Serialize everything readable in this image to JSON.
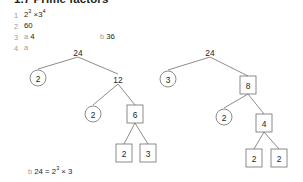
{
  "header": {
    "title": "1.7 Prime factors"
  },
  "answers": [
    {
      "number": "1",
      "parts": [
        {
          "label": "",
          "value": "2³ × 3⁴",
          "base1": "2",
          "exp1": "3",
          "base2": "3",
          "exp2": "4"
        }
      ]
    },
    {
      "number": "2",
      "parts": [
        {
          "label": "",
          "value": "60"
        }
      ]
    },
    {
      "number": "3",
      "parts": [
        {
          "label": "a",
          "value": "4"
        },
        {
          "label": "b",
          "value": "36"
        }
      ]
    },
    {
      "number": "4",
      "parts": [
        {
          "label": "a",
          "value": ""
        },
        {
          "label": "b",
          "value": "24 = 2³ × 3"
        }
      ]
    }
  ],
  "list": {
    "q1_num": "1",
    "q1_value_base1": "2",
    "q1_value_exp1": "3",
    "q1_times": "×",
    "q1_value_base2": "3",
    "q1_value_exp2": "4",
    "q2_num": "2",
    "q2_value": "60",
    "q3_num": "3",
    "q3_a_label": "a",
    "q3_a_value": "4",
    "q3_b_label": "b",
    "q3_b_value": "36",
    "q4_num": "4",
    "q4_a_label": "a",
    "q4_b_label": "b",
    "q4_b_prefix": "24 = 2",
    "q4_b_exp": "3",
    "q4_b_suffix": " × 3"
  },
  "colors": {
    "text": "#231f20",
    "muted": "#9a9a9a",
    "stroke": "#6e6e6e",
    "background": "#ffffff"
  },
  "trees": {
    "left": {
      "name": "factor-tree-24-left",
      "nodes": [
        {
          "id": "l-root",
          "label": "24",
          "shape": "plain",
          "x": 78,
          "y": 52
        },
        {
          "id": "l-c1",
          "label": "2",
          "shape": "circle",
          "x": 38,
          "y": 78
        },
        {
          "id": "l-c2",
          "label": "12",
          "shape": "plain",
          "x": 118,
          "y": 79
        },
        {
          "id": "l-c3",
          "label": "2",
          "shape": "circle",
          "x": 93,
          "y": 114
        },
        {
          "id": "l-c4",
          "label": "6",
          "shape": "box",
          "x": 135,
          "y": 114
        },
        {
          "id": "l-c5",
          "label": "2",
          "shape": "box",
          "x": 124,
          "y": 153
        },
        {
          "id": "l-c6",
          "label": "3",
          "shape": "box",
          "x": 148,
          "y": 153
        }
      ],
      "edges": [
        [
          "l-root",
          "l-c1"
        ],
        [
          "l-root",
          "l-c2"
        ],
        [
          "l-c2",
          "l-c3"
        ],
        [
          "l-c2",
          "l-c4"
        ],
        [
          "l-c4",
          "l-c5"
        ],
        [
          "l-c4",
          "l-c6"
        ]
      ]
    },
    "right": {
      "name": "factor-tree-24-right",
      "nodes": [
        {
          "id": "r-root",
          "label": "24",
          "shape": "plain",
          "x": 210,
          "y": 52
        },
        {
          "id": "r-c1",
          "label": "3",
          "shape": "circle",
          "x": 168,
          "y": 79
        },
        {
          "id": "r-c2",
          "label": "8",
          "shape": "box",
          "x": 248,
          "y": 85
        },
        {
          "id": "r-c3",
          "label": "2",
          "shape": "circle",
          "x": 224,
          "y": 117
        },
        {
          "id": "r-c4",
          "label": "4",
          "shape": "box",
          "x": 264,
          "y": 123
        },
        {
          "id": "r-c5",
          "label": "2",
          "shape": "box",
          "x": 254,
          "y": 158
        },
        {
          "id": "r-c6",
          "label": "2",
          "shape": "box",
          "x": 279,
          "y": 158
        }
      ],
      "edges": [
        [
          "r-root",
          "r-c1"
        ],
        [
          "r-root",
          "r-c2"
        ],
        [
          "r-c2",
          "r-c3"
        ],
        [
          "r-c2",
          "r-c4"
        ],
        [
          "r-c4",
          "r-c5"
        ],
        [
          "r-c4",
          "r-c6"
        ]
      ]
    }
  }
}
